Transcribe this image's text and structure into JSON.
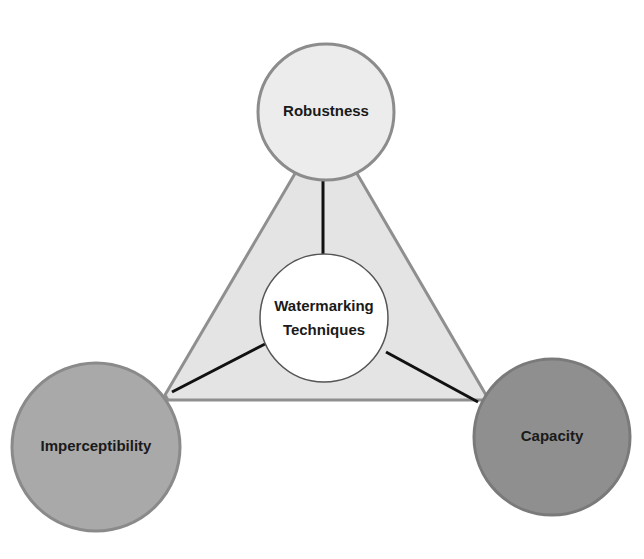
{
  "diagram": {
    "center": {
      "label_line1": "Watermarking",
      "label_line2": "Techniques",
      "fill": "#ffffff",
      "stroke": "#555555"
    },
    "nodes": [
      {
        "id": "robustness",
        "label": "Robustness",
        "position": "top",
        "fill": "#ececec",
        "stroke": "#8c8c8c"
      },
      {
        "id": "imperceptibility",
        "label": "Imperceptibility",
        "position": "bottom-left",
        "fill": "#a9a9a9",
        "stroke": "#8a8a8a"
      },
      {
        "id": "capacity",
        "label": "Capacity",
        "position": "bottom-right",
        "fill": "#8f8f8f",
        "stroke": "#7a7a7a"
      }
    ],
    "triangle": {
      "fill": "#e4e4e4",
      "stroke": "#8f8f8f"
    },
    "connector_color": "#111111"
  }
}
